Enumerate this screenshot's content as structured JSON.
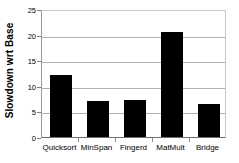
{
  "chart_data": {
    "type": "bar",
    "title": "",
    "xlabel": "",
    "ylabel": "Slowdown wrt Base",
    "categories": [
      "Quicksort",
      "MinSpan",
      "Fingerd",
      "MatMult",
      "Bridge"
    ],
    "values": [
      12.1,
      7.1,
      7.3,
      20.6,
      6.5
    ],
    "ylim": [
      0,
      25
    ],
    "yticks": [
      0,
      5,
      10,
      15,
      20,
      25
    ],
    "ytick_labels": [
      "0",
      "5",
      "10",
      "15",
      "20",
      "25"
    ],
    "grid": true,
    "grid_axis": "y",
    "legend": false,
    "bar_color": "#000000",
    "background_color": "#ffffff",
    "axis_color": "#6e6e6e",
    "gridline_color": "#b0b0b0"
  }
}
